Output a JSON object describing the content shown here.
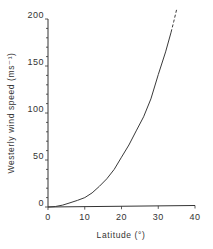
{
  "chart_data": {
    "type": "line",
    "title": "",
    "xlabel": "Latitude (°)",
    "ylabel": "Westerly wind speed (ms⁻¹)",
    "xlim": [
      0,
      40
    ],
    "ylim": [
      0,
      200
    ],
    "x_ticks": [
      0,
      10,
      20,
      30,
      40
    ],
    "y_ticks": [
      0,
      50,
      100,
      150,
      200
    ],
    "grid": false,
    "legend": null,
    "series": [
      {
        "name": "westerly wind speed",
        "style": "solid",
        "x": [
          0,
          2,
          4,
          6,
          8,
          10,
          12,
          14,
          16,
          18,
          20,
          22,
          24,
          26,
          28,
          30,
          32,
          33.5
        ],
        "y": [
          0,
          0.5,
          2,
          4.5,
          7,
          10,
          15,
          22,
          30,
          40,
          53,
          66,
          81,
          96,
          115,
          141,
          165,
          186
        ]
      },
      {
        "name": "westerly wind speed (extrapolated)",
        "style": "dashed",
        "x": [
          33.5,
          34.2,
          35
        ],
        "y": [
          186,
          197,
          210
        ]
      }
    ]
  }
}
